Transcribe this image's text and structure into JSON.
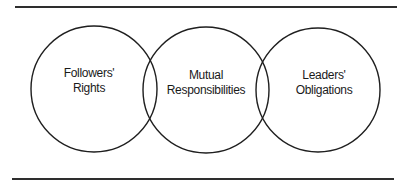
{
  "diagram": {
    "circles": [
      {
        "id": "followers-rights",
        "line1": "Followers'",
        "line2": "Rights",
        "cx": 94,
        "cy": 89,
        "r": 63
      },
      {
        "id": "mutual-responsibilities",
        "line1": "Mutual",
        "line2": "Responsibilities",
        "cx": 206,
        "cy": 90,
        "r": 63
      },
      {
        "id": "leaders-obligations",
        "line1": "Leaders'",
        "line2": "Obligations",
        "cx": 318,
        "cy": 90,
        "r": 62
      }
    ],
    "colors": {
      "stroke": "#1f1f1f",
      "rule": "#2e2e2e",
      "text": "#1a1a1a",
      "background": "#ffffff"
    }
  }
}
